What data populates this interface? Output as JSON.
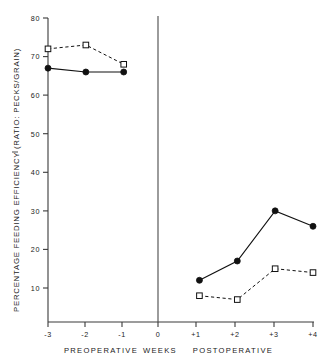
{
  "chart_data": {
    "type": "line",
    "title": "",
    "xlabel": "WEEKS",
    "ylabel": "PERCENTAGE FEEDING EFFICIENCY (RATIO: PECKS/GRAIN)",
    "x": [
      "-3",
      "-2",
      "-1",
      "0",
      "+1",
      "+2",
      "+3",
      "+4"
    ],
    "xlim": [
      -3,
      4
    ],
    "ylim": [
      0,
      80
    ],
    "yticks": [
      10,
      20,
      30,
      40,
      50,
      60,
      70,
      80
    ],
    "ytick_labels": [
      "10",
      "20",
      "30",
      "40",
      "50",
      "60",
      "70",
      "80"
    ],
    "xticks": [
      -3,
      -2,
      -1,
      0,
      1,
      2,
      3,
      4
    ],
    "xtick_labels": [
      "-3",
      "-2",
      "-1",
      "0",
      "+1",
      "+2",
      "+3",
      "+4"
    ],
    "grid": false,
    "legend": "none",
    "phase_labels": [
      "PREOPERATIVE",
      "WEEKS",
      "POSTOPERATIVE"
    ],
    "divider_x": 0,
    "series": [
      {
        "name": "filled-circle-series",
        "marker": "filled-circle",
        "line": "solid",
        "segments": [
          {
            "x": [
              -3,
              -2,
              -1
            ],
            "values": [
              67,
              66,
              66
            ]
          },
          {
            "x": [
              1,
              2,
              3,
              4
            ],
            "values": [
              12,
              17,
              30,
              26
            ]
          }
        ]
      },
      {
        "name": "open-square-series",
        "marker": "open-square",
        "line": "dashed",
        "segments": [
          {
            "x": [
              -3,
              -2,
              -1
            ],
            "values": [
              72,
              73,
              68
            ]
          },
          {
            "x": [
              1,
              2,
              3,
              4
            ],
            "values": [
              8,
              7,
              15,
              14
            ]
          }
        ]
      }
    ]
  },
  "axis": {
    "y_title": "PERCENTAGE FEEDING EFFICIENCY (RATIO: PECKS/GRAIN)",
    "ticks_y": [
      "80",
      "70",
      "60",
      "50",
      "40",
      "30",
      "20",
      "10"
    ],
    "ticks_x": [
      "-3",
      "-2",
      "-1",
      "0",
      "+1",
      "+2",
      "+3",
      "+4"
    ]
  },
  "captions": {
    "preoperative": "PREOPERATIVE",
    "weeks": "WEEKS",
    "postoperative": "POSTOPERATIVE"
  }
}
